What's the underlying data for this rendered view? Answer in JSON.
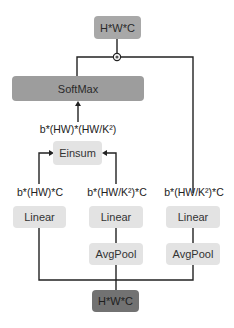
{
  "diagram": {
    "output_node": {
      "label": "H*W*C"
    },
    "softmax": {
      "label": "SoftMax"
    },
    "softmax_input_shape": {
      "label": "b*(HW)*(HW/K²)"
    },
    "einsum": {
      "label": "Einsum"
    },
    "branches": [
      {
        "shape": "b*(HW)*C",
        "linear": "Linear"
      },
      {
        "shape": "b*(HW/K²)*C",
        "linear": "Linear",
        "pool": "AvgPool"
      },
      {
        "shape": "b*(HW/K²)*C",
        "linear": "Linear",
        "pool": "AvgPool"
      }
    ],
    "input_node": {
      "label": "H*W*C"
    },
    "junction": {
      "symbol": "multiply-circle-icon"
    },
    "colors": {
      "output_box": "#a8a8a8",
      "softmax_box": "#9d9d9d",
      "light_box": "#e3e3e3",
      "input_box": "#727272",
      "wire": "#222222"
    }
  }
}
